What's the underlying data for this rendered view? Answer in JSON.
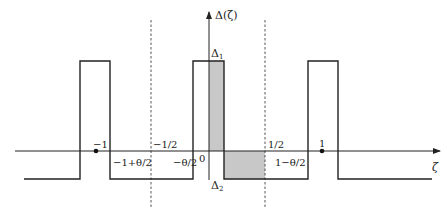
{
  "diagram": {
    "type": "periodic-step-function",
    "colors": {
      "line": "#222222",
      "shade": "#c8c8c8",
      "dashed": "#444444",
      "background": "#ffffff"
    },
    "axes": {
      "y_label": "Δ(ζ)",
      "x_label": "ζ"
    },
    "levels": {
      "upper": "Δ1",
      "lower": "Δ2",
      "upper_sub": "1",
      "lower_sub": "2",
      "upper_base": "Δ",
      "lower_base": "Δ"
    },
    "tick_labels": {
      "minus_one": "−1",
      "minus_half": "−1/2",
      "zero": "0",
      "half": "1/2",
      "one": "1",
      "minus_one_plus_theta_half": "−1+θ/2",
      "minus_theta_half": "−θ/2",
      "one_minus_theta_half": "1−θ/2"
    }
  }
}
